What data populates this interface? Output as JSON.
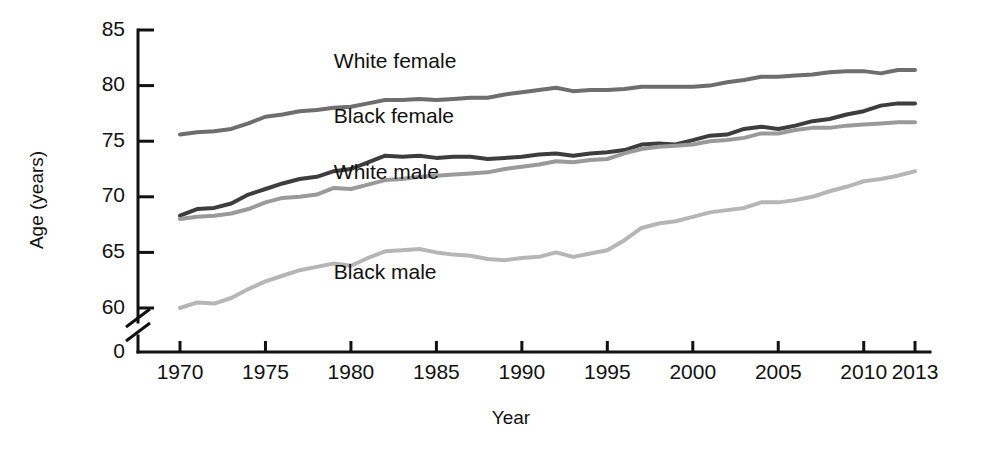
{
  "chart_data": {
    "type": "line",
    "title": "",
    "xlabel": "Year",
    "ylabel": "Age (years)",
    "xlim": [
      1970,
      2013
    ],
    "ylim": [
      58,
      85
    ],
    "y_axis_break": true,
    "y_axis_break_note": "axis broken between 0 and 58",
    "grid": false,
    "legend_position": "inline-labels",
    "xticks": [
      1970,
      1975,
      1980,
      1985,
      1990,
      1995,
      2000,
      2005,
      2010,
      2013
    ],
    "xtick_labels": [
      "1970",
      "1975",
      "1980",
      "1985",
      "1990",
      "1995",
      "2000",
      "2005",
      "2010",
      "2013"
    ],
    "yticks": [
      60,
      65,
      70,
      75,
      80,
      85
    ],
    "ytick_labels": [
      "60",
      "65",
      "70",
      "75",
      "80",
      "85"
    ],
    "y_zero_label": "0",
    "x": [
      1970,
      1971,
      1972,
      1973,
      1974,
      1975,
      1976,
      1977,
      1978,
      1979,
      1980,
      1981,
      1982,
      1983,
      1984,
      1985,
      1986,
      1987,
      1988,
      1989,
      1990,
      1991,
      1992,
      1993,
      1994,
      1995,
      1996,
      1997,
      1998,
      1999,
      2000,
      2001,
      2002,
      2003,
      2004,
      2005,
      2006,
      2007,
      2008,
      2009,
      2010,
      2011,
      2012,
      2013
    ],
    "series": [
      {
        "name": "White female",
        "color": "#6e6e6e",
        "label_x": 1979,
        "label_y": 81.6,
        "values": [
          75.6,
          75.8,
          75.9,
          76.1,
          76.6,
          77.2,
          77.4,
          77.7,
          77.8,
          78.0,
          78.1,
          78.4,
          78.7,
          78.7,
          78.8,
          78.7,
          78.8,
          78.9,
          78.9,
          79.2,
          79.4,
          79.6,
          79.8,
          79.5,
          79.6,
          79.6,
          79.7,
          79.9,
          79.9,
          79.9,
          79.9,
          80.0,
          80.3,
          80.5,
          80.8,
          80.8,
          80.9,
          81.0,
          81.2,
          81.3,
          81.3,
          81.1,
          81.4,
          81.4
        ]
      },
      {
        "name": "Black female",
        "color": "#3d3d3d",
        "label_x": 1979,
        "label_y": 76.6,
        "values": [
          68.3,
          68.9,
          69.0,
          69.4,
          70.2,
          70.7,
          71.2,
          71.6,
          71.8,
          72.3,
          72.5,
          73.1,
          73.7,
          73.6,
          73.7,
          73.5,
          73.6,
          73.6,
          73.4,
          73.5,
          73.6,
          73.8,
          73.9,
          73.7,
          73.9,
          74.0,
          74.2,
          74.7,
          74.8,
          74.7,
          75.1,
          75.5,
          75.6,
          76.1,
          76.3,
          76.1,
          76.4,
          76.8,
          77.0,
          77.4,
          77.7,
          78.2,
          78.4,
          78.4
        ]
      },
      {
        "name": "White male",
        "color": "#9a9a9a",
        "label_x": 1979,
        "label_y": 71.6,
        "values": [
          68.0,
          68.2,
          68.3,
          68.5,
          68.9,
          69.5,
          69.9,
          70.0,
          70.2,
          70.8,
          70.7,
          71.1,
          71.5,
          71.6,
          71.8,
          71.9,
          72.0,
          72.1,
          72.2,
          72.5,
          72.7,
          72.9,
          73.2,
          73.1,
          73.3,
          73.4,
          73.9,
          74.3,
          74.5,
          74.6,
          74.7,
          75.0,
          75.1,
          75.3,
          75.7,
          75.7,
          76.0,
          76.2,
          76.2,
          76.4,
          76.5,
          76.6,
          76.7,
          76.7
        ]
      },
      {
        "name": "Black male",
        "color": "#b6b6b6",
        "label_x": 1979,
        "label_y": 62.6,
        "values": [
          60.0,
          60.5,
          60.4,
          60.9,
          61.7,
          62.4,
          62.9,
          63.4,
          63.7,
          64.0,
          63.8,
          64.5,
          65.1,
          65.2,
          65.3,
          65.0,
          64.8,
          64.7,
          64.4,
          64.3,
          64.5,
          64.6,
          65.0,
          64.6,
          64.9,
          65.2,
          66.1,
          67.2,
          67.6,
          67.8,
          68.2,
          68.6,
          68.8,
          69.0,
          69.5,
          69.5,
          69.7,
          70.0,
          70.5,
          70.9,
          71.4,
          71.6,
          71.9,
          72.3
        ]
      }
    ]
  }
}
